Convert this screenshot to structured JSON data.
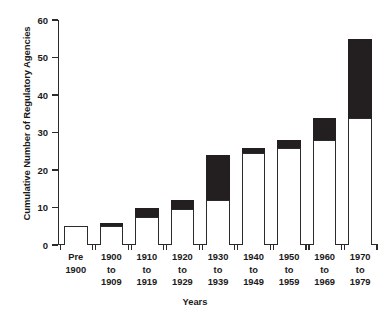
{
  "chart_data": {
    "type": "bar",
    "title": "",
    "subtitle": "",
    "xlabel": "Years",
    "ylabel": "Cumulative Number of Regulatory Agencies",
    "stacked": true,
    "grid": false,
    "legend": "none",
    "ylim": [
      0,
      60
    ],
    "yticks": [
      0,
      10,
      20,
      30,
      40,
      50,
      60
    ],
    "ytick_labels": [
      "0",
      "10",
      "20",
      "30",
      "40",
      "50",
      "60"
    ],
    "categories": [
      "Pre 1900",
      "1900 to 1909",
      "1910 to 1919",
      "1920 to 1929",
      "1930 to 1939",
      "1940 to 1949",
      "1950 to 1959",
      "1960 to 1969",
      "1970 to 1979"
    ],
    "category_lines": [
      [
        "Pre",
        "1900"
      ],
      [
        "1900",
        "to",
        "1909"
      ],
      [
        "1910",
        "to",
        "1919"
      ],
      [
        "1920",
        "to",
        "1929"
      ],
      [
        "1930",
        "to",
        "1939"
      ],
      [
        "1940",
        "to",
        "1949"
      ],
      [
        "1950",
        "to",
        "1959"
      ],
      [
        "1960",
        "to",
        "1969"
      ],
      [
        "1970",
        "to",
        "1979"
      ]
    ],
    "series": [
      {
        "name": "cumulative-prior",
        "color": "#ffffff",
        "values": [
          5,
          5,
          7.5,
          9.5,
          12,
          24.5,
          26,
          28,
          34
        ]
      },
      {
        "name": "added-in-decade",
        "color": "#231f20",
        "values": [
          0,
          1,
          2.5,
          2.5,
          12,
          1.5,
          2,
          6,
          21
        ]
      }
    ],
    "totals": [
      5,
      6,
      10,
      12,
      24,
      26,
      28,
      34,
      55
    ]
  },
  "colors": {
    "axis": "#2b2b2b",
    "bar_fill_light": "#ffffff",
    "bar_fill_dark": "#231f20",
    "background": "#ffffff",
    "text": "#1a1a1a"
  }
}
